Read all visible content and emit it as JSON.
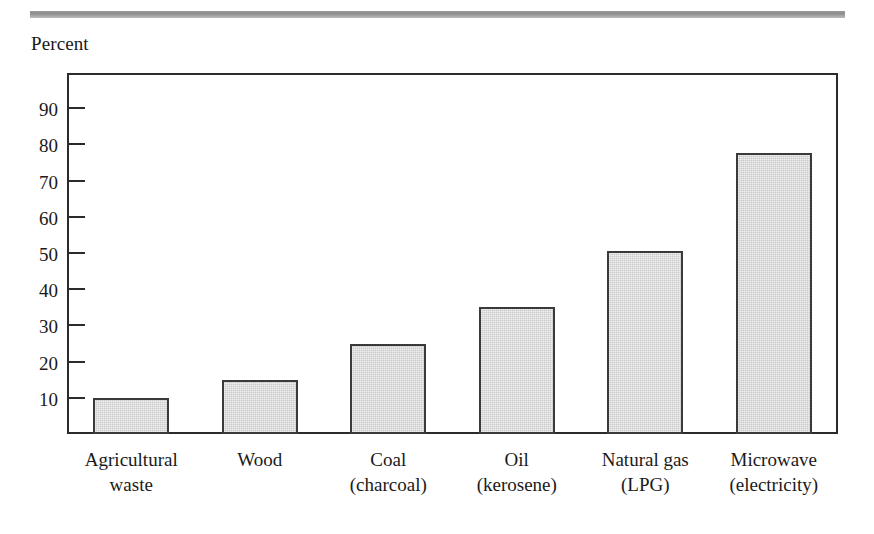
{
  "figure": {
    "axis_title": "Percent",
    "top_rule_color": "#9a9a9a",
    "frame_color": "#2b2b2b",
    "bar_fill_color": "#c9c9c9",
    "bar_border_color": "#3a3a3a"
  },
  "chart_data": {
    "type": "bar",
    "title": "",
    "xlabel": "",
    "ylabel": "Percent",
    "ylim": [
      0,
      95
    ],
    "yticks": [
      10,
      20,
      30,
      40,
      50,
      60,
      70,
      80,
      90
    ],
    "ytick_labels": [
      "10",
      "20",
      "30",
      "40",
      "50",
      "60",
      "70",
      "80",
      "90"
    ],
    "grid": false,
    "legend": false,
    "categories": [
      "Agricultural\nwaste",
      "Wood",
      "Coal\n(charcoal)",
      "Oil\n(kerosene)",
      "Natural gas\n(LPG)",
      "Microwave\n(electricity)"
    ],
    "category_lines": [
      [
        "Agricultural",
        "waste"
      ],
      [
        "Wood",
        ""
      ],
      [
        "Coal",
        "(charcoal)"
      ],
      [
        "Oil",
        "(kerosene)"
      ],
      [
        "Natural gas",
        "(LPG)"
      ],
      [
        "Microwave",
        "(electricity)"
      ]
    ],
    "values": [
      10,
      15,
      25,
      35,
      50.5,
      77.5
    ]
  }
}
